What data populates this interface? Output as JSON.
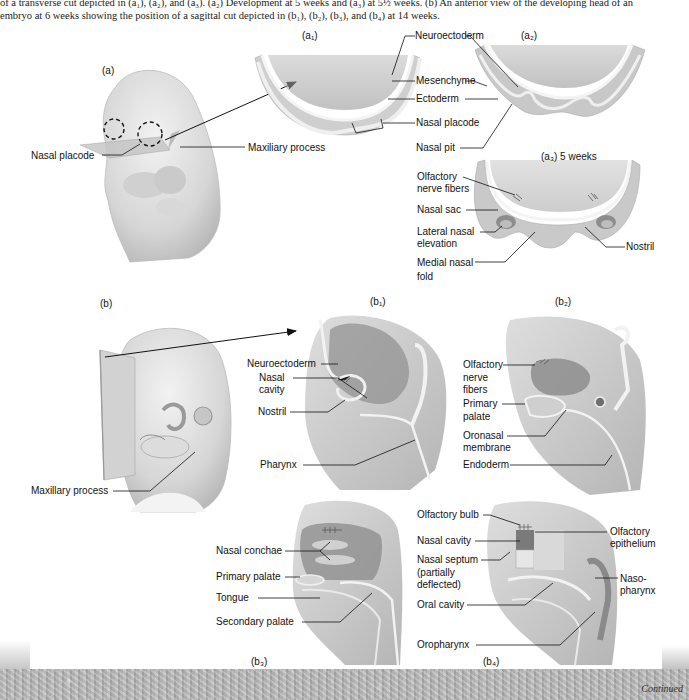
{
  "caption": {
    "line1": "of a transverse cut depicted in (a₁), (a₂), and (a₃). (a₂) Development at 5 weeks and (a₃) at 5½ weeks. (b) An anterior view of the developing head of an",
    "line2": "embryo at 6 weeks showing the position of a sagittal cut depicted in (b₁), (b₂), (b₃), and (b₄) at 14 weeks."
  },
  "panels": {
    "a": "(a)",
    "a1": "(a₁)",
    "a2": "(a₂)",
    "a3": "(a₃) 5 weeks",
    "b": "(b)",
    "b1": "(b₁)",
    "b2": "(b₂)",
    "b3": "(b₃)",
    "b4": "(b₄)"
  },
  "labels": {
    "a": {
      "nasal_placode": "Nasal placode",
      "maxillary_process": "Maxiliary process"
    },
    "a1_a2": {
      "neuroectoderm": "Neuroectoderm",
      "mesenchyme": "Mesenchyme",
      "ectoderm": "Ectoderm",
      "nasal_placode": "Nasal placode",
      "nasal_pit": "Nasal pit"
    },
    "a3": {
      "olfactory_nerve_fibers_1": "Olfactory",
      "olfactory_nerve_fibers_2": "nerve fibers",
      "nasal_sac": "Nasal sac",
      "lateral_nasal_elevation_1": "Lateral nasal",
      "lateral_nasal_elevation_2": "elevation",
      "medial_nasal_fold_1": "Medial nasal",
      "medial_nasal_fold_2": "fold",
      "nostril": "Nostril"
    },
    "b": {
      "maxillary_process": "Maxillary process"
    },
    "b1": {
      "neuroectoderm": "Neuroectoderm",
      "nasal_cavity_1": "Nasal",
      "nasal_cavity_2": "cavity",
      "nostril": "Nostril",
      "pharynx": "Pharynx"
    },
    "b2": {
      "olfactory_nerve_fibers_1": "Olfactory",
      "olfactory_nerve_fibers_2": "nerve",
      "olfactory_nerve_fibers_3": "fibers",
      "primary_palate_1": "Primary",
      "primary_palate_2": "palate",
      "oronasal_membrane_1": "Oronasal",
      "oronasal_membrane_2": "membrane",
      "endoderm": "Endoderm"
    },
    "b3": {
      "nasal_conchae": "Nasal conchae",
      "primary_palate": "Primary palate",
      "tongue": "Tongue",
      "secondary_palate": "Secondary palate"
    },
    "b4": {
      "olfactory_bulb": "Olfactory bulb",
      "nasal_cavity": "Nasal cavity",
      "nasal_septum_1": "Nasal septum",
      "nasal_septum_2": "(partially",
      "nasal_septum_3": "deflected)",
      "oral_cavity": "Oral cavity",
      "oropharynx": "Oropharynx",
      "olfactory_epithelium_1": "Olfactory",
      "olfactory_epithelium_2": "epithelium",
      "nasopharynx_1": "Naso-",
      "nasopharynx_2": "pharynx"
    }
  },
  "footer": {
    "continued": "Continued"
  },
  "colors": {
    "tissue_light": "#e4e4e4",
    "tissue_mid": "#c9c9c9",
    "tissue_dark": "#9a9a9a",
    "leader_line": "#222222",
    "footer_band": "#b5b5b5"
  }
}
